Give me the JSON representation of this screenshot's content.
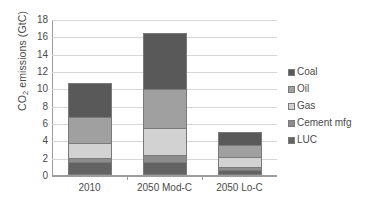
{
  "chart_data": {
    "type": "bar",
    "subtype": "stacked-bar",
    "title": "",
    "xlabel": "",
    "ylabel": "CO2 emissions (GtC)",
    "ylabel_parts": {
      "pre": "CO",
      "sub": "2",
      "post": " emissions (GtC)"
    },
    "categories": [
      "2010",
      "2050 Mod-C",
      "2050 Lo-C"
    ],
    "series": [
      {
        "name": "LUC",
        "values": [
          1.5,
          1.5,
          0.6
        ],
        "color": "#636363"
      },
      {
        "name": "Cement mfg",
        "values": [
          0.5,
          0.85,
          0.35
        ],
        "color": "#8c8c8c"
      },
      {
        "name": "Gas",
        "values": [
          1.75,
          3.05,
          1.15
        ],
        "color": "#d2d2d2"
      },
      {
        "name": "Oil",
        "values": [
          2.95,
          4.5,
          1.4
        ],
        "color": "#a0a0a0"
      },
      {
        "name": "Coal",
        "values": [
          3.9,
          6.5,
          1.5
        ],
        "color": "#595959"
      }
    ],
    "stack_order_bottom_to_top": [
      "LUC",
      "Cement mfg",
      "Gas",
      "Oil",
      "Coal"
    ],
    "totals": [
      10.6,
      16.4,
      5.0
    ],
    "ylim": [
      0,
      18
    ],
    "ytick_step": 2,
    "yticks": [
      "18",
      "16",
      "14",
      "12",
      "10",
      "8",
      "6",
      "4",
      "2",
      "0"
    ],
    "ytick_values": [
      18,
      16,
      14,
      12,
      10,
      8,
      6,
      4,
      2,
      0
    ],
    "grid": true,
    "grid_axis": "y",
    "grid_color": "#d6d6d6",
    "legend_position": "right",
    "legend_entries": [
      {
        "label": "Coal",
        "color": "#595959"
      },
      {
        "label": "Oil",
        "color": "#a0a0a0"
      },
      {
        "label": "Gas",
        "color": "#d2d2d2"
      },
      {
        "label": "Cement mfg",
        "color": "#8c8c8c"
      },
      {
        "label": "LUC",
        "color": "#636363"
      }
    ],
    "axis_color": "#9c9c9c",
    "background": "#ffffff"
  }
}
